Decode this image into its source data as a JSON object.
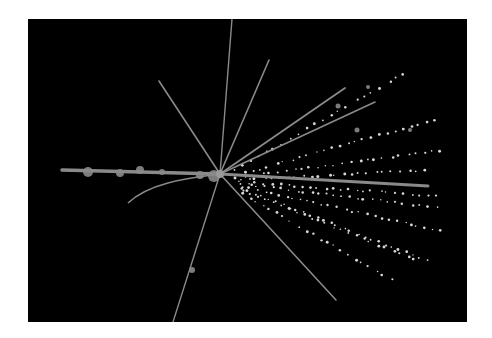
{
  "image": {
    "description": "Particle collision event display: tracks radiating from a central vertex on black background",
    "background": "#000000",
    "page_background": "#ffffff",
    "track_color": "#8a8a8a",
    "dot_color": "#d8d8d8",
    "frame": {
      "x": 28,
      "y": 19,
      "width": 439,
      "height": 303
    },
    "vertex": {
      "x": 220,
      "y": 174
    }
  },
  "tracks": [
    {
      "name": "track-up",
      "x1": 220,
      "y1": 174,
      "x2": 232,
      "y2": 19,
      "width": 1.4
    },
    {
      "name": "track-up-right",
      "x1": 220,
      "y1": 174,
      "x2": 269,
      "y2": 60,
      "width": 1.6
    },
    {
      "name": "track-up-left",
      "x1": 220,
      "y1": 174,
      "x2": 159,
      "y2": 81,
      "width": 1.6
    },
    {
      "name": "track-fan-1",
      "x1": 220,
      "y1": 174,
      "x2": 345,
      "y2": 88,
      "width": 1.8
    },
    {
      "name": "track-fan-2",
      "x1": 220,
      "y1": 174,
      "x2": 375,
      "y2": 102,
      "width": 1.6
    },
    {
      "name": "track-right-main",
      "x1": 220,
      "y1": 174,
      "x2": 428,
      "y2": 186,
      "width": 3
    },
    {
      "name": "track-down-left",
      "x1": 220,
      "y1": 174,
      "x2": 173,
      "y2": 322,
      "width": 1.4
    },
    {
      "name": "track-down-right",
      "x1": 220,
      "y1": 174,
      "x2": 336,
      "y2": 300,
      "width": 1.6
    },
    {
      "name": "track-left-main",
      "x1": 220,
      "y1": 174,
      "x2": 62,
      "y2": 170,
      "width": 3.5
    }
  ],
  "curved_tracks": [
    {
      "name": "track-left-curve",
      "d": "M220,174 C190,178 150,182 128,203",
      "width": 1.6
    }
  ],
  "dotted_tracks": [
    {
      "name": "dots-1",
      "x1": 232,
      "y1": 172,
      "x2": 410,
      "y2": 70,
      "count": 22
    },
    {
      "name": "dots-2",
      "x1": 235,
      "y1": 176,
      "x2": 440,
      "y2": 118,
      "count": 26
    },
    {
      "name": "dots-3",
      "x1": 235,
      "y1": 178,
      "x2": 445,
      "y2": 150,
      "count": 26
    },
    {
      "name": "dots-4",
      "x1": 238,
      "y1": 180,
      "x2": 430,
      "y2": 170,
      "count": 24
    },
    {
      "name": "dots-5",
      "x1": 240,
      "y1": 184,
      "x2": 440,
      "y2": 208,
      "count": 26
    },
    {
      "name": "dots-6",
      "x1": 240,
      "y1": 186,
      "x2": 445,
      "y2": 232,
      "count": 28
    },
    {
      "name": "dots-7",
      "x1": 240,
      "y1": 188,
      "x2": 430,
      "y2": 262,
      "count": 28
    },
    {
      "name": "dots-8",
      "x1": 242,
      "y1": 190,
      "x2": 420,
      "y2": 262,
      "count": 24
    },
    {
      "name": "dots-9",
      "x1": 240,
      "y1": 192,
      "x2": 395,
      "y2": 282,
      "count": 22
    },
    {
      "name": "dots-10",
      "x1": 238,
      "y1": 182,
      "x2": 440,
      "y2": 196,
      "count": 26
    }
  ],
  "blobs": [
    {
      "cx": 192,
      "cy": 270,
      "r": 3
    },
    {
      "cx": 338,
      "cy": 106,
      "r": 2.5
    },
    {
      "cx": 368,
      "cy": 87,
      "r": 2
    },
    {
      "cx": 357,
      "cy": 130,
      "r": 2.5
    },
    {
      "cx": 410,
      "cy": 130,
      "r": 2
    },
    {
      "cx": 88,
      "cy": 172,
      "r": 5
    },
    {
      "cx": 120,
      "cy": 173,
      "r": 4
    },
    {
      "cx": 140,
      "cy": 170,
      "r": 4
    },
    {
      "cx": 162,
      "cy": 172,
      "r": 3
    },
    {
      "cx": 200,
      "cy": 175,
      "r": 4
    },
    {
      "cx": 214,
      "cy": 176,
      "r": 6
    }
  ]
}
